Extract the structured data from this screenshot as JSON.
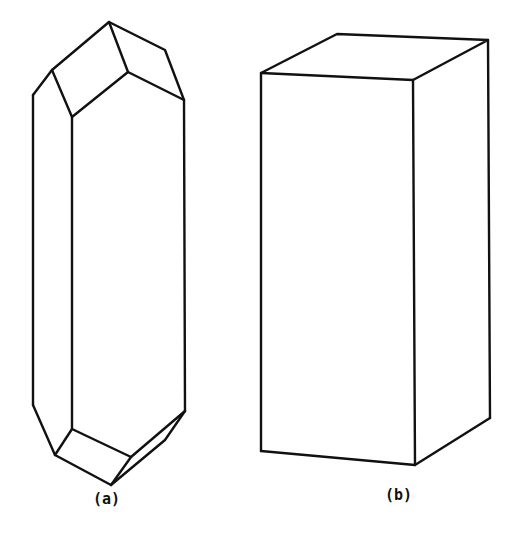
{
  "figures": [
    {
      "id": "a",
      "label": "(a)",
      "description": "elongated prismatic crystal with pyramidal terminations"
    },
    {
      "id": "b",
      "label": "(b)",
      "description": "rectangular prism (box)"
    }
  ],
  "colors": {
    "stroke": "#111111",
    "background": "#ffffff"
  }
}
